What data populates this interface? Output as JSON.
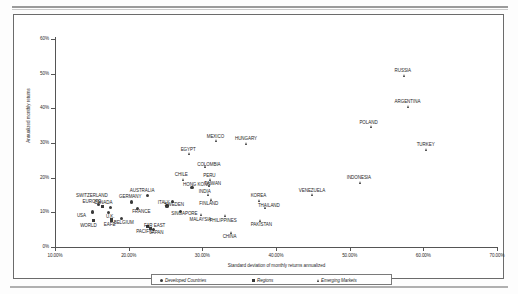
{
  "chart": {
    "xlabel": "Standard deviation of monthly returns annualized",
    "ylabel": "Annualized monthly returns",
    "x_ticks": [
      "10.00%",
      "20.00%",
      "30.00%",
      "40.00%",
      "50.00%",
      "60.00%",
      "70.00%"
    ],
    "y_ticks": [
      "60%",
      "50%",
      "40%",
      "30%",
      "20%",
      "10%",
      "0%"
    ],
    "legend": [
      {
        "label": "Developed Countries",
        "marker": "circle"
      },
      {
        "label": "Regions",
        "marker": "square"
      },
      {
        "label": "Emerging Markets",
        "marker": "triangle"
      }
    ]
  },
  "chart_data": {
    "type": "scatter",
    "title": "",
    "xlabel": "Standard deviation of monthly returns annualized",
    "ylabel": "Annualized monthly returns",
    "xlim": [
      10,
      70
    ],
    "ylim": [
      0,
      60
    ],
    "xticks": [
      10,
      20,
      30,
      40,
      50,
      60,
      70
    ],
    "yticks": [
      0,
      10,
      20,
      30,
      40,
      50,
      60
    ],
    "xtick_labels": [
      "10.00%",
      "20.00%",
      "30.00%",
      "40.00%",
      "50.00%",
      "60.00%",
      "70.00%"
    ],
    "ytick_labels": [
      "0%",
      "10%",
      "20%",
      "30%",
      "40%",
      "50%",
      "60%"
    ],
    "grid": false,
    "legend_position": "bottom",
    "series": [
      {
        "name": "Developed Countries",
        "marker": "circle",
        "points": [
          {
            "label": "SWITZERLAND",
            "x": 15.9,
            "y": 12.3,
            "label_dx": -9,
            "label_dy": -9
          },
          {
            "label": "USA",
            "x": 15.1,
            "y": 10.1,
            "label_dx": -12,
            "label_dy": 4
          },
          {
            "label": "U.K.",
            "x": 17.3,
            "y": 9.9,
            "label_dx": 2,
            "label_dy": 4
          },
          {
            "label": "FRANCE",
            "x": 21.2,
            "y": 11.0,
            "label_dx": 2,
            "label_dy": 3
          },
          {
            "label": "GERMANY",
            "x": 20.4,
            "y": 13.0,
            "label_dx": -4,
            "label_dy": -5
          },
          {
            "label": "ITALY",
            "x": 25.2,
            "y": 11.8,
            "label_dx": -3,
            "label_dy": -4
          },
          {
            "label": "CANADA",
            "x": 17.5,
            "y": 11.5,
            "label_dx": -9,
            "label_dy": -5
          },
          {
            "label": "BELGIUM",
            "x": 19.0,
            "y": 8.2,
            "label_dx": 1,
            "label_dy": 4
          },
          {
            "label": "AUSTRALIA",
            "x": 22.6,
            "y": 14.8,
            "label_dx": -7,
            "label_dy": -5
          },
          {
            "label": "JAPAN",
            "x": 23.4,
            "y": 5.0,
            "label_dx": 2,
            "label_dy": 3
          },
          {
            "label": "HONG KONG",
            "x": 28.6,
            "y": 17.2,
            "label_dx": 2,
            "label_dy": -3
          },
          {
            "label": "SINGAPORE",
            "x": 27.0,
            "y": 10.2,
            "label_dx": 2,
            "label_dy": 2
          },
          {
            "label": "SWEDEN",
            "x": 26.0,
            "y": 13.1,
            "label_dx": -1,
            "label_dy": 3
          }
        ]
      },
      {
        "name": "Regions",
        "marker": "square",
        "points": [
          {
            "label": "WORLD",
            "x": 15.2,
            "y": 7.6,
            "label_dx": -7,
            "label_dy": 5
          },
          {
            "label": "EAFE",
            "x": 17.7,
            "y": 7.8,
            "label_dx": -3,
            "label_dy": 5
          },
          {
            "label": "EUROPE",
            "x": 16.5,
            "y": 11.6,
            "label_dx": -13,
            "label_dy": -5
          },
          {
            "label": "PACIFIC",
            "x": 22.6,
            "y": 5.9,
            "label_dx": -3,
            "label_dy": 5
          },
          {
            "label": "FAR EAST",
            "x": 23.0,
            "y": 5.4,
            "label_dx": 3,
            "label_dy": -3
          }
        ]
      },
      {
        "name": "Emerging Markets",
        "marker": "triangle",
        "points": [
          {
            "label": "CHILE",
            "x": 27.5,
            "y": 19.4,
            "label_dx": -3,
            "label_dy": -5
          },
          {
            "label": "PERU",
            "x": 31.2,
            "y": 19.3,
            "label_dx": -3,
            "label_dy": -5
          },
          {
            "label": "COLOMBIA",
            "x": 30.5,
            "y": 23.0,
            "label_dx": 1,
            "label_dy": -3
          },
          {
            "label": "EGYPT",
            "x": 28.3,
            "y": 26.8,
            "label_dx": -3,
            "label_dy": -5
          },
          {
            "label": "MEXICO",
            "x": 32.0,
            "y": 30.5,
            "label_dx": -3,
            "label_dy": -5
          },
          {
            "label": "HUNGARY",
            "x": 36.0,
            "y": 29.6,
            "label_dx": -3,
            "label_dy": -6
          },
          {
            "label": "TAIWAN",
            "x": 31.0,
            "y": 17.6,
            "label_dx": 2,
            "label_dy": -2
          },
          {
            "label": "INDIA",
            "x": 30.9,
            "y": 14.9,
            "label_dx": -4,
            "label_dy": -4
          },
          {
            "label": "FINLAND",
            "x": 31.3,
            "y": 13.6,
            "label_dx": -4,
            "label_dy": 4
          },
          {
            "label": "MALAYSIA",
            "x": 30.0,
            "y": 9.4,
            "label_dx": -3,
            "label_dy": 5
          },
          {
            "label": "PHILIPPINES",
            "x": 33.2,
            "y": 8.9,
            "label_dx": -3,
            "label_dy": 4
          },
          {
            "label": "CHINA",
            "x": 34.0,
            "y": 4.2,
            "label_dx": -3,
            "label_dy": 4
          },
          {
            "label": "KOREA",
            "x": 37.8,
            "y": 13.4,
            "label_dx": -3,
            "label_dy": -5
          },
          {
            "label": "THAILAND",
            "x": 38.6,
            "y": 11.3,
            "label_dx": 2,
            "label_dy": -2
          },
          {
            "label": "PAKISTAN",
            "x": 37.9,
            "y": 7.6,
            "label_dx": 0,
            "label_dy": 4
          },
          {
            "label": "VENEZUELA",
            "x": 45.0,
            "y": 15.0,
            "label_dx": -3,
            "label_dy": -5
          },
          {
            "label": "INDONESIA",
            "x": 51.5,
            "y": 18.5,
            "label_dx": -3,
            "label_dy": -5
          },
          {
            "label": "POLAND",
            "x": 53.0,
            "y": 34.6,
            "label_dx": -5,
            "label_dy": -5
          },
          {
            "label": "RUSSIA",
            "x": 57.5,
            "y": 49.5,
            "label_dx": -3,
            "label_dy": -5
          },
          {
            "label": "ARGENTINA",
            "x": 58.0,
            "y": 40.5,
            "label_dx": -3,
            "label_dy": -5
          },
          {
            "label": "TURKEY",
            "x": 60.5,
            "y": 28.0,
            "label_dx": -3,
            "label_dy": -5
          }
        ]
      }
    ]
  }
}
